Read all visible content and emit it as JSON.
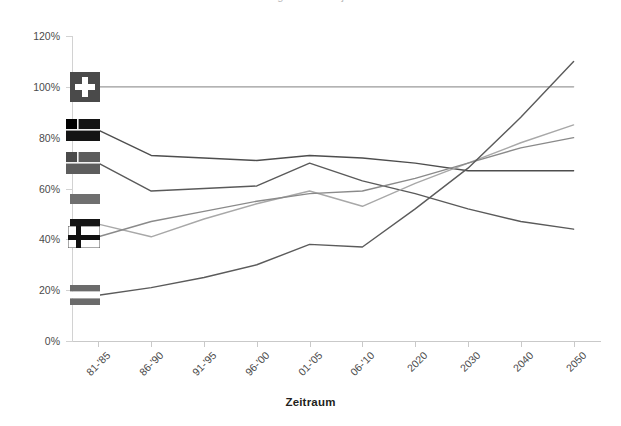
{
  "title_clipped": "Entwicklung der Anteile je Zeitraum",
  "axes": {
    "x_title": "Zeitraum",
    "y_ticks": [
      "0%",
      "20%",
      "40%",
      "60%",
      "80%",
      "100%",
      "120%"
    ],
    "x_ticks": [
      "81-'85",
      "86-'90",
      "91-'95",
      "96-'00",
      "01-'05",
      "06-'10",
      "2020",
      "2030",
      "2040",
      "2050"
    ]
  },
  "colors": {
    "series_1": "#9a9a9a",
    "series_2": "#4e4e4e",
    "series_3": "#5a5a5a",
    "series_4": "#a8a8a8",
    "series_5": "#8a8a8a",
    "series_6": "#5b5b5b",
    "axis": "#c9c9c9",
    "text": "#4b4b4b"
  },
  "markers": [
    {
      "name": "flag-marker-switzerland",
      "label": "Schweiz",
      "value": 100
    },
    {
      "name": "flag-marker-canton-dark-a",
      "label": "Land 2",
      "value": 83
    },
    {
      "name": "flag-marker-canton-dark-b",
      "label": "Land 3",
      "value": 70
    },
    {
      "name": "flag-marker-gray-band",
      "label": "Land 4",
      "value": 56
    },
    {
      "name": "flag-marker-dark-band",
      "label": "Land 5",
      "value": 46
    },
    {
      "name": "flag-marker-nordic-cross",
      "label": "Land 6",
      "value": 41
    },
    {
      "name": "flag-marker-tricolor",
      "label": "Land 7",
      "value": 18
    }
  ],
  "chart_data": {
    "type": "line",
    "title": "Entwicklung der Anteile je Zeitraum",
    "xlabel": "Zeitraum",
    "ylabel": "",
    "ylim": [
      0,
      120
    ],
    "ytick_step": 20,
    "grid": false,
    "legend": "flag-markers-at-left-edge",
    "categories": [
      "81-'85",
      "86-'90",
      "91-'95",
      "96-'00",
      "01-'05",
      "06-'10",
      "2020",
      "2030",
      "2040",
      "2050"
    ],
    "series": [
      {
        "name": "Schweiz",
        "marker": "flag-marker-switzerland",
        "color": "#9a9a9a",
        "values": [
          100,
          100,
          100,
          100,
          100,
          100,
          100,
          100,
          100,
          100
        ]
      },
      {
        "name": "Land 2",
        "marker": "flag-marker-canton-dark-a",
        "color": "#4e4e4e",
        "values": [
          83,
          73,
          72,
          71,
          73,
          72,
          70,
          67,
          67,
          67
        ]
      },
      {
        "name": "Land 3",
        "marker": "flag-marker-canton-dark-b",
        "color": "#5a5a5a",
        "values": [
          70,
          59,
          60,
          61,
          70,
          63,
          58,
          52,
          47,
          44
        ]
      },
      {
        "name": "Land 4",
        "marker": "flag-marker-gray-band",
        "color": "#a8a8a8",
        "values": [
          46,
          41,
          48,
          54,
          59,
          53,
          62,
          70,
          78,
          85
        ]
      },
      {
        "name": "Land 5",
        "marker": "flag-marker-dark-band",
        "color": "#8a8a8a",
        "values": [
          41,
          47,
          51,
          55,
          58,
          59,
          64,
          70,
          76,
          80
        ]
      },
      {
        "name": "Land 7",
        "marker": "flag-marker-tricolor",
        "color": "#5b5b5b",
        "values": [
          18,
          21,
          25,
          30,
          38,
          37,
          52,
          68,
          88,
          110
        ]
      }
    ]
  }
}
